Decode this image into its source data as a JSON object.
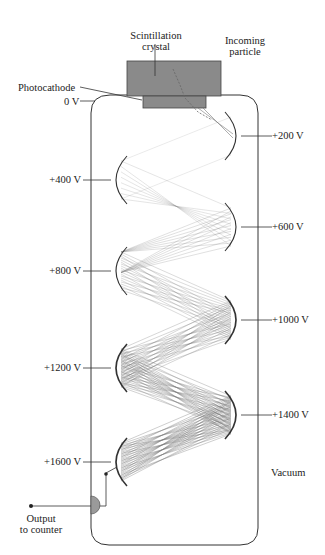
{
  "diagram": {
    "labels": {
      "crystal": "Scintillation\ncrystal",
      "crystal_line1": "Scintillation",
      "crystal_line2": "crystal",
      "particle_line1": "Incoming",
      "particle_line2": "particle",
      "photocathode": "Photocathode",
      "cathode_voltage": "0 V",
      "vacuum": "Vacuum",
      "output_line1": "Output",
      "output_line2": "to counter"
    },
    "dynodes": [
      {
        "voltage": "+200 V",
        "side": "right",
        "y": 136
      },
      {
        "voltage": "+400 V",
        "side": "left",
        "y": 180
      },
      {
        "voltage": "+600 V",
        "side": "right",
        "y": 227
      },
      {
        "voltage": "+800 V",
        "side": "left",
        "y": 271
      },
      {
        "voltage": "+1000 V",
        "side": "right",
        "y": 320
      },
      {
        "voltage": "+1200 V",
        "side": "left",
        "y": 368
      },
      {
        "voltage": "+1400 V",
        "side": "right",
        "y": 415
      },
      {
        "voltage": "+1600 V",
        "side": "left",
        "y": 462
      }
    ],
    "colors": {
      "crystal": "#8a8a8a",
      "photocathode": "#8a8a8a",
      "outline": "#333333",
      "electron_paths": "#777777",
      "output_contact": "#9a9a9a"
    }
  },
  "caption": "Diagram of a scintillation counter and photomultiplier tube"
}
